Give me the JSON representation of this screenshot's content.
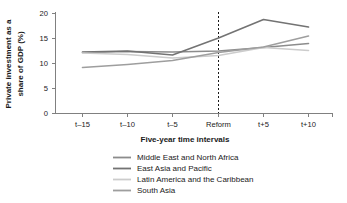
{
  "chart_data": {
    "type": "line",
    "title": "",
    "xlabel": "Five-year time intervals",
    "ylabel_line1": "Private investment as a",
    "ylabel_line2": "share of GDP (%)",
    "ylabel": "Private investment as a share of GDP (%)",
    "categories": [
      "t–15",
      "t–10",
      "t–5",
      "Reform",
      "t+5",
      "t+10"
    ],
    "ytick_labels": [
      "0",
      "5",
      "10",
      "15",
      "20"
    ],
    "ytick_values": [
      0,
      5,
      10,
      15,
      20
    ],
    "ylim": [
      0,
      20
    ],
    "grid": false,
    "legend_position": "bottom-center",
    "annotations": [
      {
        "name": "reform-marker",
        "kind": "vertical-dashed-line",
        "at_category": "Reform"
      }
    ],
    "series": [
      {
        "name": "Middle East and North Africa",
        "color": "#8c8c8c",
        "values": [
          12.2,
          12.4,
          12.3,
          12.5,
          13.2,
          14.0
        ]
      },
      {
        "name": "East Asia and Pacific",
        "color": "#737373",
        "values": [
          12.3,
          12.5,
          11.7,
          15.1,
          18.8,
          17.3
        ]
      },
      {
        "name": "Latin America and the Caribbean",
        "color": "#cccccc",
        "values": [
          12.1,
          11.8,
          11.1,
          11.6,
          13.2,
          12.6
        ]
      },
      {
        "name": "South Asia",
        "color": "#9e9e9e",
        "values": [
          9.2,
          9.8,
          10.6,
          12.2,
          13.3,
          15.5
        ]
      }
    ]
  },
  "colors": {
    "axis": "#808080",
    "text": "#1a1a1a",
    "background": "#ffffff",
    "reform_dash": "#1a1a1a"
  }
}
